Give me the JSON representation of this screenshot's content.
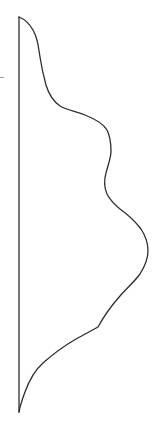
{
  "figure": {
    "background_color": "#ffffff",
    "stroke_color": "#2d2d2d",
    "tick_color": "#999999",
    "stroke_width": "1.3",
    "tick_width": "1.2",
    "profile_curve_path": "M 19 17 C 24 19 29 23 33 30 C 37 37 38 44 40 57 C 42 70 43 74 46 85 C 49 95 53 101 60 106 C 67 110 75 111 85 115 C 95 119 103 123 107 130 C 110 136 111 143 111 151 C 111 158 108 165 106 173 C 104 180 104 187 107 194 C 110 200 114 204 120 209 C 127 214 135 221 141 229 C 145 235 148 243 148 251 C 148 258 145 266 140 274 C 135 281 128 287 120 296 C 112 305 104 316 98 327 C 93 330 85 334 76 339 C 64 346 52 355 43 363 C 35 370 29 381 25 392 C 22 400 20 406 19 412",
    "spine_line_path": "M 19 17 L 19 412",
    "edge_tick_path": "M 0 77.5 L 3.5 77.5"
  }
}
